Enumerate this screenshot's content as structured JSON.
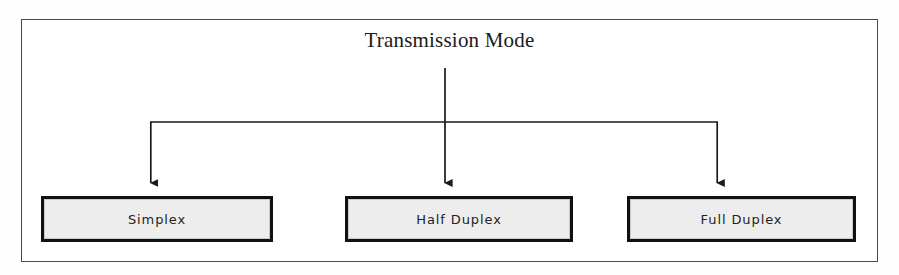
{
  "diagram": {
    "type": "tree-hierarchy",
    "root": {
      "label": "Transmission Mode"
    },
    "children": [
      {
        "label": "Simplex"
      },
      {
        "label": "Half Duplex"
      },
      {
        "label": "Full Duplex"
      }
    ],
    "connector_style": "elbow-arrows-downward",
    "colors": {
      "frame_border": "#4a4a4a",
      "box_border": "#111111",
      "box_fill": "#ededed",
      "connector": "#1a1a1a",
      "text": "#232323",
      "background": "#ffffff"
    }
  }
}
